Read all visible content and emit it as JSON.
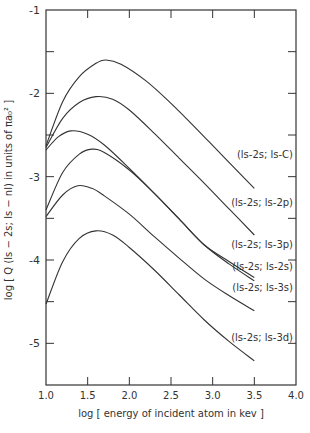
{
  "chart_data": {
    "type": "line",
    "title": "",
    "xlabel": "log [ energy of incident atom in kev ]",
    "ylabel": "log [ Q (ls - 2s; ls - nl) in units of πa₀² ]",
    "xlim": [
      1.0,
      4.0
    ],
    "ylim": [
      -5.5,
      -1.0
    ],
    "x_ticks": [
      "1.0",
      "1.5",
      "2.0",
      "2.5",
      "3.0",
      "3.5",
      "4.0"
    ],
    "y_ticks": [
      "-1",
      "-2",
      "-3",
      "-4",
      "-5"
    ],
    "grid": false,
    "legend_position": "inline labels at right end of curves",
    "series": [
      {
        "name": "(ls-2s; ls-C)",
        "x": [
          1.0,
          1.2,
          1.4,
          1.6,
          1.72,
          1.9,
          2.2,
          2.5,
          2.8,
          3.1,
          3.5
        ],
        "values": [
          -2.63,
          -2.1,
          -1.8,
          -1.64,
          -1.6,
          -1.65,
          -1.85,
          -2.12,
          -2.42,
          -2.73,
          -3.14
        ]
      },
      {
        "name": "(ls-2s; ls-2p)",
        "x": [
          1.0,
          1.2,
          1.4,
          1.6,
          1.8,
          2.0,
          2.3,
          2.6,
          2.9,
          3.2,
          3.5
        ],
        "values": [
          -2.65,
          -2.3,
          -2.11,
          -2.04,
          -2.07,
          -2.2,
          -2.48,
          -2.78,
          -3.08,
          -3.39,
          -3.7
        ]
      },
      {
        "name": "(ls-2s; ls-3p)",
        "x": [
          1.0,
          1.15,
          1.3,
          1.5,
          1.7,
          2.0,
          2.3,
          2.6,
          2.9,
          3.2,
          3.5
        ],
        "values": [
          -2.68,
          -2.52,
          -2.45,
          -2.49,
          -2.62,
          -2.9,
          -3.2,
          -3.51,
          -3.82,
          -4.02,
          -4.21
        ]
      },
      {
        "name": "(ls-2s; ls-2s)",
        "x": [
          1.0,
          1.2,
          1.4,
          1.55,
          1.7,
          2.0,
          2.3,
          2.6,
          2.9,
          3.2,
          3.5
        ],
        "values": [
          -3.4,
          -2.95,
          -2.73,
          -2.67,
          -2.71,
          -2.92,
          -3.2,
          -3.51,
          -3.82,
          -4.05,
          -4.25
        ]
      },
      {
        "name": "(ls-2s; ls-3s)",
        "x": [
          1.0,
          1.2,
          1.38,
          1.55,
          1.7,
          2.0,
          2.3,
          2.6,
          2.9,
          3.2,
          3.5
        ],
        "values": [
          -3.48,
          -3.22,
          -3.11,
          -3.14,
          -3.23,
          -3.45,
          -3.72,
          -3.98,
          -4.23,
          -4.43,
          -4.61
        ]
      },
      {
        "name": "(ls-2s; ls-3d)",
        "x": [
          1.0,
          1.2,
          1.4,
          1.6,
          1.8,
          2.0,
          2.3,
          2.6,
          2.9,
          3.2,
          3.5
        ],
        "values": [
          -4.53,
          -4.02,
          -3.74,
          -3.65,
          -3.7,
          -3.85,
          -4.12,
          -4.42,
          -4.72,
          -4.98,
          -5.21
        ]
      }
    ]
  },
  "labels": {
    "curve_labels": [
      "(ls-2s; ls-C)",
      "(ls-2s; ls-2p)",
      "(ls-2s; ls-3p)",
      "(ls-2s; ls-2s)",
      "(ls-2s; ls-3s)",
      "(ls-2s; ls-3d)"
    ],
    "curve_label_y": [
      158,
      206,
      248,
      270,
      291,
      341
    ],
    "x_axis_title": "log [ energy of incident atom in kev ]",
    "y_axis_title": "log [ Q (ls − 2s; ls − nl) in units of πa₀² ]"
  },
  "style": {
    "ink": "#333333",
    "background": "#ffffff"
  }
}
